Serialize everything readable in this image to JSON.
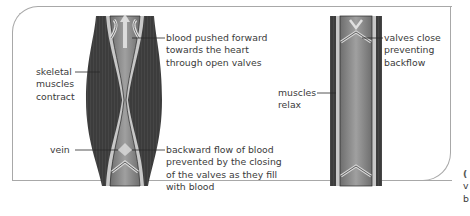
{
  "diagram": {
    "left_panel": {
      "state": "muscles contracting",
      "labels": {
        "blood_pushed": "blood pushed forward\ntowards the heart\nthrough open valves",
        "skeletal_muscles": "skeletal\nmuscles\ncontract",
        "vein": "vein",
        "backward_flow": "backward flow of blood\nprevented by the closing\nof the valves as they fill\nwith blood"
      }
    },
    "right_panel": {
      "state": "muscles relaxing",
      "labels": {
        "valves_close": "valves close\npreventing\nbackflow",
        "muscles_relax": "muscles\nrelax"
      }
    },
    "cropped_corner_text": {
      "line1": "(",
      "line2": "v",
      "line3": "b"
    },
    "colors": {
      "muscle": "#3c3c3c",
      "vein_wall": "#c8c8c8",
      "blood": "#8c8c8c",
      "frame": "#a8a8a8",
      "text": "#3a3a3a",
      "leader_line": "#2a2a2a"
    }
  }
}
